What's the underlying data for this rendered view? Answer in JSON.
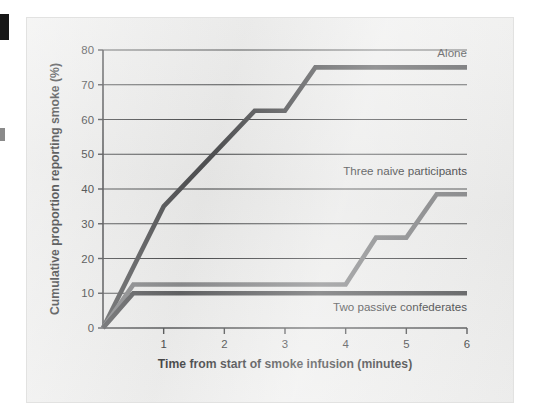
{
  "figure": {
    "background_color": "#ececeb",
    "page_color": "#ffffff",
    "edge_mark_color": "#171717"
  },
  "chart_data": {
    "type": "line",
    "title": "",
    "subtitle": "",
    "xlabel": "Time from start of smoke infusion (minutes)",
    "ylabel": "Cumulative proportion reporting smoke (%)",
    "xlim": [
      0,
      6
    ],
    "ylim": [
      0,
      80
    ],
    "xticks": [
      1,
      2,
      3,
      4,
      5,
      6
    ],
    "xtick_labels": [
      "1",
      "2",
      "3",
      "4",
      "5",
      "6"
    ],
    "yticks": [
      0,
      10,
      20,
      30,
      40,
      50,
      60,
      70,
      80
    ],
    "ytick_labels": [
      "0",
      "10",
      "20",
      "30",
      "40",
      "50",
      "60",
      "70",
      "80"
    ],
    "grid": "horizontal",
    "grid_color": "#3b3c3e",
    "legend_position": "inline-right-of-lines",
    "series": [
      {
        "name": "Alone",
        "color": "#4c4d4f",
        "label_anchor": {
          "x": 6.0,
          "y": 78.0
        },
        "points": [
          {
            "x": 0.0,
            "y": 0
          },
          {
            "x": 1.0,
            "y": 35
          },
          {
            "x": 2.5,
            "y": 62.5
          },
          {
            "x": 3.0,
            "y": 62.5
          },
          {
            "x": 3.5,
            "y": 75
          },
          {
            "x": 6.0,
            "y": 75
          }
        ]
      },
      {
        "name": "Three naive participants",
        "color": "#7c7d7f",
        "label_anchor": {
          "x": 6.0,
          "y": 44.0
        },
        "points": [
          {
            "x": 0.0,
            "y": 0
          },
          {
            "x": 0.5,
            "y": 12.5
          },
          {
            "x": 4.0,
            "y": 12.5
          },
          {
            "x": 4.5,
            "y": 26
          },
          {
            "x": 5.0,
            "y": 26
          },
          {
            "x": 5.5,
            "y": 38.5
          },
          {
            "x": 6.0,
            "y": 38.5
          }
        ]
      },
      {
        "name": "Two passive confederates",
        "color": "#4c4d4f",
        "label_anchor": {
          "x": 6.0,
          "y": 5.0
        },
        "points": [
          {
            "x": 0.0,
            "y": 0
          },
          {
            "x": 0.5,
            "y": 10
          },
          {
            "x": 6.0,
            "y": 10
          }
        ]
      }
    ]
  }
}
